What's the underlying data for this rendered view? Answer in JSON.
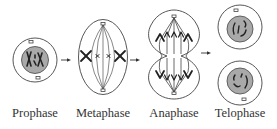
{
  "colors": {
    "outline": "#444444",
    "nucleus_fill": "#a9a9a9",
    "chromosome": "#222222",
    "background": "#ffffff",
    "label": "#333333"
  },
  "stages": [
    {
      "id": "prophase",
      "label": "Prophase",
      "label_x": 35
    },
    {
      "id": "metaphase",
      "label": "Metaphase",
      "label_x": 103
    },
    {
      "id": "anaphase",
      "label": "Anaphase",
      "label_x": 174
    },
    {
      "id": "telophase",
      "label": "Telophase",
      "label_x": 240
    }
  ],
  "arrows": [
    {
      "from": "prophase",
      "to": "metaphase"
    },
    {
      "from": "metaphase",
      "to": "anaphase"
    },
    {
      "from": "anaphase",
      "to": "telophase"
    }
  ]
}
